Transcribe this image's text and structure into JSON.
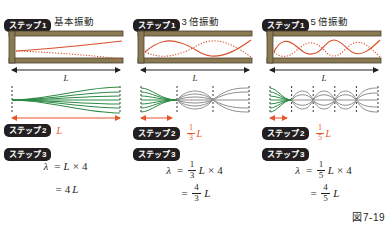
{
  "figure": {
    "number": "図7-19",
    "length_symbol": "L"
  },
  "labels": {
    "step1": "ステップ",
    "step1_num": "1",
    "step2": "ステップ",
    "step2_num": "2",
    "step3": "ステップ",
    "step3_num": "3"
  },
  "colors": {
    "accent_red": "#e8552c",
    "wave_red": "#d94f2b",
    "wave_green": "#2e8b45",
    "wave_gray": "#8e8e8e",
    "tube_wall": "#8a7a52",
    "badge_bg": "#231f20",
    "text": "#231f20"
  },
  "columns": [
    {
      "id": "fundamental",
      "subtitle": "基本振動",
      "length_label": "L",
      "step2_value": {
        "type": "plain",
        "text": "L"
      },
      "step3_line1": {
        "lhs": "λ",
        "eq": "=",
        "coef": null,
        "sym": "L",
        "op": "×",
        "factor": "4"
      },
      "step3_line2": {
        "eq": "=",
        "frac": null,
        "coef": "4",
        "sym": "L"
      },
      "segments": 5,
      "green_segments": 5,
      "harmonic": 1,
      "measure_fraction": 1
    },
    {
      "id": "third-harmonic",
      "subtitle": "3 倍振動",
      "length_label": "L",
      "step2_value": {
        "type": "fraction",
        "num": "1",
        "den": "3",
        "sym": "L"
      },
      "step3_line1": {
        "lhs": "λ",
        "eq": "=",
        "coef": {
          "num": "1",
          "den": "3"
        },
        "sym": "L",
        "op": "×",
        "factor": "4"
      },
      "step3_line2": {
        "eq": "=",
        "frac": {
          "num": "4",
          "den": "3"
        },
        "sym": "L"
      },
      "segments": 3,
      "green_segments": 1,
      "harmonic": 3,
      "measure_fraction": 0.3333
    },
    {
      "id": "fifth-harmonic",
      "subtitle": "5 倍振動",
      "length_label": "L",
      "step2_value": {
        "type": "fraction",
        "num": "1",
        "den": "5",
        "sym": "L"
      },
      "step3_line1": {
        "lhs": "λ",
        "eq": "=",
        "coef": {
          "num": "1",
          "den": "5"
        },
        "sym": "L",
        "op": "×",
        "factor": "4"
      },
      "step3_line2": {
        "eq": "=",
        "frac": {
          "num": "4",
          "den": "5"
        },
        "sym": "L"
      },
      "segments": 5,
      "green_segments": 1,
      "harmonic": 5,
      "measure_fraction": 0.2
    }
  ]
}
